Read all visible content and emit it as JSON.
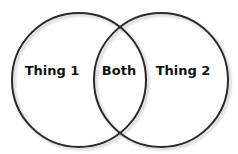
{
  "diagram": {
    "type": "venn",
    "circles": [
      {
        "name": "thing-1",
        "label": "Thing 1",
        "cx": 79,
        "cy": 80,
        "r": 67
      },
      {
        "name": "thing-2",
        "label": "Thing 2",
        "cx": 161,
        "cy": 80,
        "r": 67
      }
    ],
    "intersection": {
      "label": "Both"
    },
    "colors": {
      "stroke": "#2a2a2a",
      "fill": "#ffffff",
      "text": "#111111",
      "shadow": "#cfcfcf"
    }
  }
}
